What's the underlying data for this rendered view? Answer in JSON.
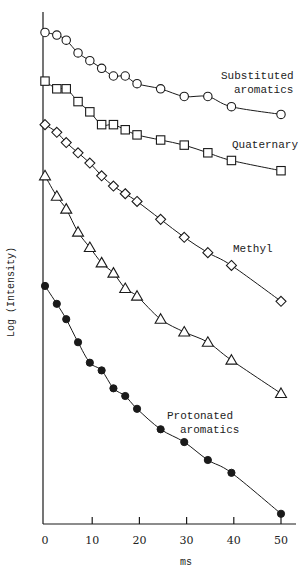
{
  "chart_data": {
    "type": "scatter",
    "title": "",
    "xlabel": "ms",
    "ylabel": "Log (Intensity)",
    "xlim": [
      0,
      52
    ],
    "ylim": [
      0,
      100
    ],
    "y_units": "arbitrary (no tick labels shown)",
    "grid": false,
    "legend": "inline labels at right",
    "x_ticks": [
      0,
      10,
      20,
      30,
      40,
      50
    ],
    "x": [
      0,
      2.5,
      4.5,
      7,
      9.5,
      12,
      14.5,
      17,
      19.5,
      24.5,
      29.5,
      34.5,
      39.5,
      50
    ],
    "series": [
      {
        "name": "Substituted aromatics",
        "label_lines": [
          "Substituted",
          "aromatics"
        ],
        "marker": "open-circle",
        "values": [
          96,
          95.5,
          94.5,
          92,
          90.5,
          89,
          87.5,
          87.5,
          86,
          85,
          83.5,
          83.5,
          81.5,
          80
        ]
      },
      {
        "name": "Quaternary",
        "label_lines": [
          "Quaternary"
        ],
        "marker": "open-square",
        "values": [
          86.5,
          85,
          85,
          82.5,
          80.5,
          78,
          78,
          77,
          76,
          75,
          74,
          72.5,
          71,
          69
        ]
      },
      {
        "name": "Methyl",
        "label_lines": [
          "Methyl"
        ],
        "marker": "open-diamond",
        "values": [
          78,
          76.5,
          74.5,
          72.5,
          70.5,
          68,
          66,
          64.5,
          63,
          59.5,
          56,
          53,
          50.5,
          43.5
        ]
      },
      {
        "name": "(unlabeled)",
        "label_lines": [],
        "marker": "open-triangle",
        "values": [
          68,
          64,
          61.5,
          57,
          54,
          51,
          49,
          46,
          44.5,
          40,
          37.5,
          35.5,
          32,
          25.5
        ]
      },
      {
        "name": "Protonated aromatics",
        "label_lines": [
          "Protonated",
          "aromatics"
        ],
        "marker": "filled-circle",
        "values": [
          46.5,
          43,
          40,
          35.5,
          31.5,
          30,
          26.5,
          25,
          22.5,
          18.5,
          16,
          12.5,
          10,
          2
        ]
      }
    ],
    "annotations": [
      {
        "text": "Substituted aromatics",
        "near_series": 0
      },
      {
        "text": "Quaternary",
        "near_series": 1
      },
      {
        "text": "Methyl",
        "near_series": 2
      },
      {
        "text": "Protonated aromatics",
        "near_series": 4
      }
    ]
  },
  "layout": {
    "plot": {
      "x0": 45,
      "px_per_x": 4.72,
      "y_bottom": 524,
      "px_per_y": 5.12,
      "axis_x": 43,
      "axis_top": 12,
      "axis_right": 296
    },
    "label_positions": [
      {
        "x": 221,
        "y": 79,
        "lines_x": [
          221,
          234
        ]
      },
      {
        "x": 232,
        "y": 148,
        "lines_x": [
          232
        ]
      },
      {
        "x": 233,
        "y": 252,
        "lines_x": [
          233
        ]
      },
      null,
      {
        "x": 167,
        "y": 419,
        "lines_x": [
          167,
          180
        ]
      }
    ],
    "ylabel_pos": {
      "x": 14,
      "y": 292
    },
    "xlabel_pos": {
      "x": 186,
      "y": 565
    }
  },
  "colors": {
    "ink": "#1a1a1a",
    "background": "#ffffff"
  }
}
